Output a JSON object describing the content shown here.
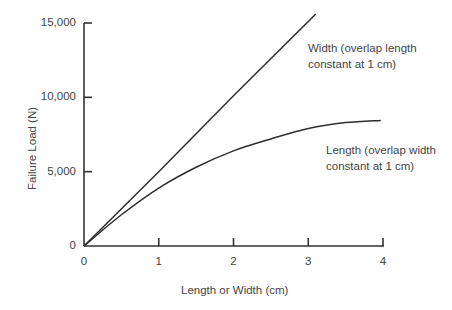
{
  "chart_data": {
    "type": "line",
    "title": "",
    "xlabel": "Length or Width (cm)",
    "ylabel": "Failure Load (N)",
    "xlim": [
      0,
      4
    ],
    "ylim": [
      0,
      15000
    ],
    "xticks": [
      "0",
      "1",
      "2",
      "3",
      "4"
    ],
    "yticks": [
      "0",
      "5,000",
      "10,000",
      "15,000"
    ],
    "grid": false,
    "legend": "inline labels",
    "series": [
      {
        "name": "Width (overlap length constant at 1 cm)",
        "x": [
          0,
          1,
          2,
          3,
          3.1
        ],
        "y": [
          0,
          5000,
          10100,
          15100,
          15600
        ]
      },
      {
        "name": "Length (overlap width constant at 1 cm)",
        "x": [
          0,
          0.5,
          1,
          1.5,
          2,
          2.5,
          3,
          3.5,
          3.97
        ],
        "y": [
          0,
          2100,
          3900,
          5300,
          6400,
          7200,
          7900,
          8300,
          8450
        ]
      }
    ]
  },
  "labels": {
    "width_line1": "Width (overlap length",
    "width_line2": "constant at 1 cm)",
    "length_line1": "Length (overlap width",
    "length_line2": "constant at 1 cm)"
  }
}
